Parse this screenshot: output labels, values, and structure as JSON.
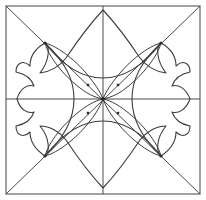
{
  "canvas": {
    "width": 206,
    "height": 200,
    "background": "#ffffff",
    "title": "Scalloped Four-Petal Quilt Block Pattern"
  },
  "style": {
    "stroke": "#3c3c3c",
    "border_stroke": "#8a8a8a",
    "stroke_width": 1,
    "border_width": 1.6,
    "fill": "none",
    "node_color": "#2b2b2b",
    "node_radius": 1.4
  },
  "geometry": {
    "border": {
      "x": 6,
      "y": 6,
      "width": 194,
      "height": 188
    },
    "center": {
      "x": 103,
      "y": 99
    },
    "midlines": {
      "horizontal": {
        "x1": 6,
        "y1": 99,
        "x2": 200,
        "y2": 99
      },
      "vertical": {
        "x1": 103,
        "y1": 6,
        "x2": 103,
        "y2": 194
      }
    },
    "diagonals": [
      {
        "x1": 6,
        "y1": 6,
        "x2": 200,
        "y2": 194
      },
      {
        "x1": 200,
        "y1": 6,
        "x2": 6,
        "y2": 194
      }
    ],
    "nodes": [
      {
        "name": "node-top-left",
        "x": 45,
        "y": 43
      },
      {
        "name": "node-top-right",
        "x": 161,
        "y": 43
      },
      {
        "name": "node-bottom-right",
        "x": 161,
        "y": 156
      },
      {
        "name": "node-bottom-left",
        "x": 45,
        "y": 156
      }
    ],
    "inner_marks": [
      {
        "x": 88,
        "y": 85
      },
      {
        "x": 118,
        "y": 85
      },
      {
        "x": 118,
        "y": 113
      },
      {
        "x": 88,
        "y": 113
      }
    ],
    "flower": {
      "petal_tip_top": {
        "x": 103,
        "y": 10
      },
      "petal_tip_bottom": {
        "x": 103,
        "y": 188
      },
      "petal_tip_left": {
        "x": 17,
        "y": 99
      },
      "petal_tip_right": {
        "x": 190,
        "y": 99
      },
      "lobes": 12,
      "cusps": [
        {
          "x": 40,
          "y": 73
        },
        {
          "x": 166,
          "y": 73
        },
        {
          "x": 166,
          "y": 126
        },
        {
          "x": 40,
          "y": 126
        }
      ]
    },
    "inner_arcs": {
      "count": 4,
      "description": "four arcs bowing outward from center along N, E, S, W"
    },
    "diagonal_leaves": {
      "count": 4,
      "description": "narrow lens shapes along each diagonal from corner node to center"
    }
  },
  "labels": {
    "block_name": "",
    "caption": ""
  }
}
